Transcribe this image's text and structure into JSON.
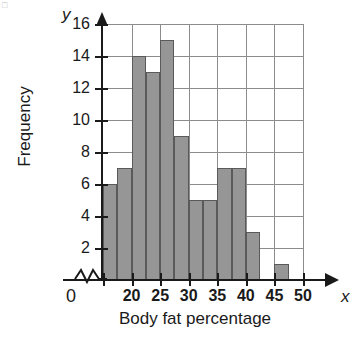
{
  "chart_data": {
    "type": "bar",
    "title": "",
    "subtitle": "",
    "xlabel": "Body fat percentage",
    "ylabel": "Frequency",
    "xlim": [
      15,
      50
    ],
    "ylim": [
      0,
      16
    ],
    "grid": true,
    "legend": null,
    "bin_width": 2.5,
    "bin_starts": [
      15,
      17.5,
      20,
      22.5,
      25,
      27.5,
      30,
      32.5,
      35,
      37.5,
      40,
      42.5,
      45
    ],
    "bin_ends": [
      17.5,
      20,
      22.5,
      25,
      27.5,
      30,
      32.5,
      35,
      37.5,
      40,
      42.5,
      45,
      47.5
    ],
    "categories": [
      "15-17.5",
      "17.5-20",
      "20-22.5",
      "22.5-25",
      "25-27.5",
      "27.5-30",
      "30-32.5",
      "32.5-35",
      "35-37.5",
      "37.5-40",
      "40-42.5",
      "42.5-45",
      "45-47.5"
    ],
    "values": [
      6,
      7,
      14,
      13,
      15,
      9,
      5,
      5,
      7,
      7,
      3,
      0,
      1
    ],
    "x_ticks": [
      20,
      25,
      30,
      35,
      40,
      45,
      50
    ],
    "x_tick_labels": [
      "20",
      "25",
      "30",
      "35",
      "40",
      "45",
      "50"
    ],
    "y_ticks": [
      2,
      4,
      6,
      8,
      10,
      12,
      14,
      16
    ],
    "y_tick_labels": [
      "2",
      "4",
      "6",
      "8",
      "10",
      "12",
      "14",
      "16"
    ],
    "origin_label": "0",
    "x_axis_letter": "x",
    "y_axis_letter": "y",
    "axis_break": true,
    "bar_color": "#969696",
    "bar_edge_color": "#5a5a5a",
    "grid_color": "#8c8c8c",
    "axis_color": "#1a1a1a",
    "background_color": "#ffffff"
  }
}
